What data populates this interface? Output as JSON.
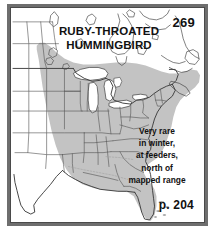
{
  "plate": {
    "species_name": "RUBY-THROATED\nHUMMINGBIRD",
    "plate_number": "269",
    "page_reference": "p. 204",
    "winter_note": "Very rare\nin winter,\nat feeders,\nnorth of\nmapped range"
  },
  "map": {
    "title": "Ruby-throated Hummingbird range map",
    "region": "Eastern North America",
    "colors": {
      "range_fill": "#c3c3c3",
      "land_fill": "#ffffff",
      "water_fill": "#ffffff",
      "border_line": "#3c3c3c",
      "state_line": "#555555",
      "frame_outer": "#6e6e6e",
      "frame_inner": "#4a4a4a",
      "text": "#111111"
    },
    "legend": {
      "range_shading_label": "breeding / mapped range",
      "unshaded_label": "outside mapped range"
    }
  }
}
